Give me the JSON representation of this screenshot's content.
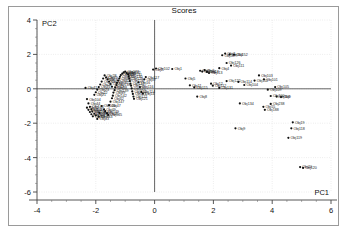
{
  "chart_data": {
    "type": "scatter",
    "title": "Scores",
    "xlabel": "PC1",
    "ylabel": "PC2",
    "xlim": [
      -4,
      6
    ],
    "ylim": [
      -6,
      4
    ],
    "xticks": [
      -4,
      -2,
      0,
      2,
      4,
      6
    ],
    "yticks": [
      -6,
      -4,
      -2,
      0,
      2,
      4
    ],
    "xtick_labels": [
      "-4",
      "-2",
      "0",
      "2",
      "4",
      "6"
    ],
    "ytick_labels": [
      "-6",
      "-4",
      "-2",
      "0",
      "2",
      "4"
    ],
    "grid": true,
    "grid_style": "dotted",
    "grid_color": "#cccccc",
    "axis_line_color": "#555555",
    "marker_color": "#111111",
    "marker_size": 1.1,
    "label_prefix": "Obj",
    "legend": null,
    "series": [
      {
        "name": "scores",
        "points": [
          {
            "label": "Obj41",
            "x": -2.35,
            "y": 0.05
          },
          {
            "label": "Obj104",
            "x": -2.3,
            "y": -0.6
          },
          {
            "label": "Obj44",
            "x": -2.25,
            "y": -0.85
          },
          {
            "label": "Obj144",
            "x": -2.2,
            "y": -1.05
          },
          {
            "label": "Obj46",
            "x": -2.15,
            "y": -1.2
          },
          {
            "label": "Obj146",
            "x": -2.12,
            "y": -1.32
          },
          {
            "label": "Obj48",
            "x": -2.05,
            "y": -1.45
          },
          {
            "label": "Obj148",
            "x": -2.0,
            "y": -1.55
          },
          {
            "label": "Obj43",
            "x": -1.95,
            "y": -1.75
          },
          {
            "label": "Obj143",
            "x": -1.9,
            "y": -1.62
          },
          {
            "label": "Obj40",
            "x": -1.88,
            "y": -1.4
          },
          {
            "label": "Obj140",
            "x": -1.8,
            "y": -1.0
          },
          {
            "label": "Obj49",
            "x": -1.72,
            "y": -1.2
          },
          {
            "label": "Obj149",
            "x": -1.68,
            "y": -1.3
          },
          {
            "label": "Obj45",
            "x": -1.62,
            "y": -1.42
          },
          {
            "label": "Obj145",
            "x": -1.58,
            "y": -1.52
          },
          {
            "label": "Obj47",
            "x": -1.55,
            "y": -0.95
          },
          {
            "label": "Obj147",
            "x": -1.5,
            "y": -0.75
          },
          {
            "label": "Obj42",
            "x": -1.45,
            "y": -0.55
          },
          {
            "label": "Obj142",
            "x": -1.42,
            "y": -0.4
          },
          {
            "label": "Obj39",
            "x": -1.4,
            "y": -0.22
          },
          {
            "label": "Obj139",
            "x": -1.36,
            "y": -0.08
          },
          {
            "label": "Obj38",
            "x": -1.34,
            "y": 0.08
          },
          {
            "label": "Obj138",
            "x": -1.3,
            "y": 0.22
          },
          {
            "label": "Obj37",
            "x": -1.28,
            "y": 0.35
          },
          {
            "label": "Obj137",
            "x": -1.24,
            "y": 0.48
          },
          {
            "label": "Obj36",
            "x": -1.2,
            "y": 0.6
          },
          {
            "label": "Obj136",
            "x": -1.18,
            "y": 0.7
          },
          {
            "label": "Obj35",
            "x": -1.15,
            "y": 0.8
          },
          {
            "label": "Obj135",
            "x": -1.1,
            "y": 0.88
          },
          {
            "label": "Obj34",
            "x": -1.05,
            "y": 0.95
          },
          {
            "label": "Obj133",
            "x": -1.0,
            "y": 1.0
          },
          {
            "label": "Obj132",
            "x": -0.95,
            "y": 0.92
          },
          {
            "label": "Obj131",
            "x": -0.9,
            "y": 0.84
          },
          {
            "label": "Obj130",
            "x": -0.88,
            "y": 0.72
          },
          {
            "label": "Obj129",
            "x": -0.86,
            "y": 0.6
          },
          {
            "label": "Obj128",
            "x": -0.84,
            "y": 0.45
          },
          {
            "label": "Obj127",
            "x": -0.82,
            "y": 0.3
          },
          {
            "label": "Obj126",
            "x": -0.8,
            "y": 0.18
          },
          {
            "label": "Obj125",
            "x": -0.78,
            "y": 0.02
          },
          {
            "label": "Obj124",
            "x": -0.76,
            "y": -0.15
          },
          {
            "label": "Obj123",
            "x": -0.74,
            "y": -0.3
          },
          {
            "label": "Obj122",
            "x": -0.72,
            "y": -0.45
          },
          {
            "label": "Obj121",
            "x": -0.7,
            "y": -0.58
          },
          {
            "label": "Obj33",
            "x": -1.45,
            "y": 0.12
          },
          {
            "label": "Obj32",
            "x": -1.5,
            "y": 0.28
          },
          {
            "label": "Obj31",
            "x": -1.55,
            "y": 0.42
          },
          {
            "label": "Obj30",
            "x": -1.6,
            "y": 0.55
          },
          {
            "label": "Obj29",
            "x": -1.65,
            "y": 0.66
          },
          {
            "label": "Obj28",
            "x": -1.7,
            "y": 0.78
          },
          {
            "label": "Obj27",
            "x": -1.75,
            "y": 0.6
          },
          {
            "label": "Obj26",
            "x": -1.8,
            "y": 0.42
          },
          {
            "label": "Obj25",
            "x": -1.85,
            "y": 0.25
          },
          {
            "label": "Obj24",
            "x": -1.9,
            "y": 0.1
          },
          {
            "label": "Obj23",
            "x": -1.95,
            "y": -0.05
          },
          {
            "label": "Obj22",
            "x": -2.0,
            "y": -0.2
          },
          {
            "label": "Obj21",
            "x": -2.05,
            "y": -0.35
          },
          {
            "label": "Obj50",
            "x": -2.1,
            "y": -1.6
          },
          {
            "label": "Obj150",
            "x": -2.15,
            "y": -1.48
          },
          {
            "label": "Obj51",
            "x": -2.2,
            "y": -1.35
          },
          {
            "label": "Obj151",
            "x": -2.25,
            "y": -1.22
          },
          {
            "label": "Obj52",
            "x": -2.3,
            "y": -1.1
          },
          {
            "label": "Obj16",
            "x": -0.55,
            "y": 0.38
          },
          {
            "label": "Obj116",
            "x": -0.5,
            "y": 0.1
          },
          {
            "label": "Obj114",
            "x": -0.45,
            "y": -0.18
          },
          {
            "label": "Obj14",
            "x": -0.4,
            "y": -0.28
          },
          {
            "label": "Obj17",
            "x": -0.35,
            "y": 0.55
          },
          {
            "label": "Obj117",
            "x": -0.3,
            "y": 0.68
          },
          {
            "label": "Obj2",
            "x": -0.05,
            "y": 1.12
          },
          {
            "label": "Obj102",
            "x": 0.05,
            "y": 1.18
          },
          {
            "label": "Obj1",
            "x": 0.6,
            "y": 1.15
          },
          {
            "label": "Obj5",
            "x": 1.05,
            "y": 0.6
          },
          {
            "label": "Obj115",
            "x": 1.35,
            "y": 0.08
          },
          {
            "label": "Obj11",
            "x": 1.2,
            "y": 0.2
          },
          {
            "label": "Obj6",
            "x": 1.55,
            "y": 1.05
          },
          {
            "label": "Obj106",
            "x": 1.62,
            "y": 1.0
          },
          {
            "label": "Obj3",
            "x": 1.7,
            "y": 1.08
          },
          {
            "label": "Obj13",
            "x": 1.78,
            "y": 0.98
          },
          {
            "label": "Obj113",
            "x": 1.85,
            "y": 0.92
          },
          {
            "label": "Obj12",
            "x": 1.92,
            "y": 0.3
          },
          {
            "label": "Obj112",
            "x": 1.98,
            "y": 0.18
          },
          {
            "label": "Obj4",
            "x": 2.2,
            "y": 1.2
          },
          {
            "label": "Obj107",
            "x": 2.3,
            "y": 1.95
          },
          {
            "label": "Obj7",
            "x": 2.4,
            "y": 2.05
          },
          {
            "label": "Obj110",
            "x": 2.55,
            "y": 2.0
          },
          {
            "label": "Obj152",
            "x": 2.7,
            "y": 1.98
          },
          {
            "label": "Obj111",
            "x": 2.6,
            "y": 1.35
          },
          {
            "label": "Obj126b",
            "x": 2.45,
            "y": 1.5
          },
          {
            "label": "Obj8",
            "x": 1.45,
            "y": -0.45
          },
          {
            "label": "Obj131b",
            "x": 2.2,
            "y": 0.05
          },
          {
            "label": "Obj122b",
            "x": 2.45,
            "y": 0.45
          },
          {
            "label": "Obj114b",
            "x": 2.85,
            "y": 0.4
          },
          {
            "label": "Obj104b",
            "x": 3.05,
            "y": 0.22
          },
          {
            "label": "Obj103",
            "x": 3.55,
            "y": 0.78
          },
          {
            "label": "Obj101",
            "x": 3.72,
            "y": 0.55
          },
          {
            "label": "Obj102b",
            "x": 3.4,
            "y": 0.48
          },
          {
            "label": "Obj105",
            "x": 4.1,
            "y": 0.1
          },
          {
            "label": "Obj109",
            "x": 3.85,
            "y": -0.05
          },
          {
            "label": "Obj100",
            "x": 3.95,
            "y": -0.42
          },
          {
            "label": "Obj116b",
            "x": 4.15,
            "y": -0.45
          },
          {
            "label": "Obj9b",
            "x": 4.3,
            "y": -0.48
          },
          {
            "label": "Obj134",
            "x": 2.9,
            "y": -0.85
          },
          {
            "label": "Obj238",
            "x": 3.95,
            "y": -0.88
          },
          {
            "label": "Obj55",
            "x": 3.7,
            "y": -1.05
          },
          {
            "label": "Obj188",
            "x": 3.75,
            "y": -1.22
          },
          {
            "label": "Obj9",
            "x": 2.75,
            "y": -2.3
          },
          {
            "label": "Obj19",
            "x": 4.7,
            "y": -1.95
          },
          {
            "label": "Obj118",
            "x": 4.65,
            "y": -2.3
          },
          {
            "label": "Obj119",
            "x": 4.55,
            "y": -2.85
          },
          {
            "label": "Obj20",
            "x": 4.95,
            "y": -4.55
          },
          {
            "label": "Obj120",
            "x": 5.05,
            "y": -4.6
          }
        ]
      }
    ]
  }
}
